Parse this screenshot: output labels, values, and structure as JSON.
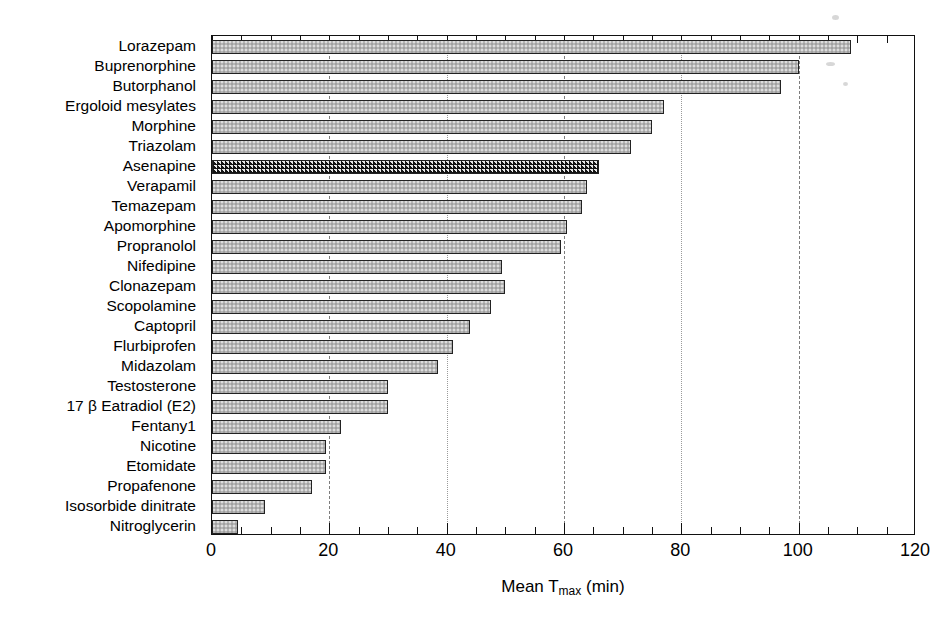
{
  "chart_data": {
    "type": "bar",
    "orientation": "horizontal",
    "title": "",
    "subtitle": "",
    "xlabel": "Mean Tmax (min)",
    "xlabel_parts": {
      "prefix": "Mean T",
      "sub": "max",
      "suffix": " (min)"
    },
    "ylabel": "",
    "xlim": [
      0,
      120
    ],
    "ylim": null,
    "xticks": [
      0,
      20,
      40,
      60,
      80,
      100,
      120
    ],
    "xticklabels": [
      "0",
      "20",
      "40",
      "60",
      "80",
      "100",
      "120"
    ],
    "minor_tick_step": 5,
    "grid": {
      "x": true,
      "y": false,
      "style": "dashed",
      "at": [
        20,
        40,
        60,
        80,
        100
      ]
    },
    "legend": null,
    "highlight_category": "Asenapine",
    "categories": [
      "Lorazepam",
      "Buprenorphine",
      "Butorphanol",
      "Ergoloid mesylates",
      "Morphine",
      "Triazolam",
      "Asenapine",
      "Verapamil",
      "Temazepam",
      "Apomorphine",
      "Propranolol",
      "Nifedipine",
      "Clonazepam",
      "Scopolamine",
      "Captopril",
      "Flurbiprofen",
      "Midazolam",
      "Testosterone",
      "17 β Eatradiol (E2)",
      "Fentany1",
      "Nicotine",
      "Etomidate",
      "Propafenone",
      "Isosorbide dinitrate",
      "Nitroglycerin"
    ],
    "values": [
      109,
      100,
      97,
      77,
      75,
      71.5,
      66,
      64,
      63,
      60.5,
      59.5,
      49.5,
      50,
      47.5,
      44,
      41,
      38.5,
      30,
      30,
      22,
      19.5,
      19.5,
      17,
      9,
      4.5
    ],
    "series": [
      {
        "name": "Mean Tmax",
        "values": [
          109,
          100,
          97,
          77,
          75,
          71.5,
          66,
          64,
          63,
          60.5,
          59.5,
          49.5,
          50,
          47.5,
          44,
          41,
          38.5,
          30,
          30,
          22,
          19.5,
          19.5,
          17,
          9,
          4.5
        ]
      }
    ],
    "colors": {
      "bar_fill": "#b6b6b6",
      "bar_edge": "#222222",
      "highlight_hatch": "#141414",
      "grid": "#7d7d7d",
      "axis": "#111111",
      "text": "#000000",
      "background": "#ffffff"
    }
  }
}
